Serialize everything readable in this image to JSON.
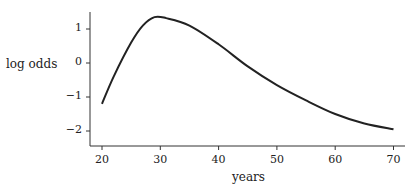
{
  "chart_data": {
    "type": "line",
    "title": "",
    "xlabel": "years",
    "ylabel": "log odds",
    "xlim": [
      18,
      72
    ],
    "ylim": [
      -2.5,
      1.5
    ],
    "xticks": [
      20,
      30,
      40,
      50,
      60,
      70
    ],
    "yticks": [
      -2,
      -1,
      0,
      1
    ],
    "grid": false,
    "series": [
      {
        "name": "log odds",
        "x": [
          20,
          22,
          25,
          27,
          29,
          31,
          35,
          40,
          45,
          50,
          55,
          60,
          65,
          70
        ],
        "y": [
          -1.2,
          -0.4,
          0.6,
          1.1,
          1.35,
          1.32,
          1.1,
          0.55,
          -0.1,
          -0.65,
          -1.1,
          -1.5,
          -1.78,
          -1.95
        ]
      }
    ]
  }
}
